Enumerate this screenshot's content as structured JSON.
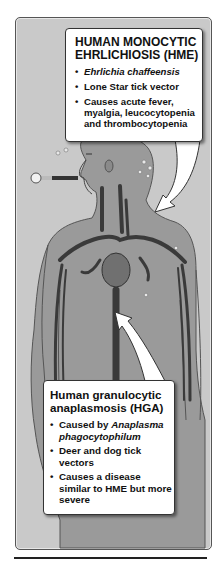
{
  "hme_callout": {
    "title_line1": "HUMAN MONOCYTIC",
    "title_line2": "EHRLICHIOSIS (HME)",
    "bullets": [
      {
        "pre": "",
        "italic": "Ehrlichia chaffeensis",
        "post": ""
      },
      {
        "pre": "Lone Star tick vector",
        "italic": "",
        "post": ""
      },
      {
        "pre": "Causes acute fever, myalgia, leucocytopenia and  thrombocytopenia",
        "italic": "",
        "post": ""
      }
    ]
  },
  "hga_callout": {
    "title_line1": "Human granulocytic",
    "title_line2": "anaplasmosis (HGA)",
    "bullets": [
      {
        "pre": "Caused by ",
        "italic": "Anaplasma phagocytophilum",
        "post": ""
      },
      {
        "pre": "Deer and dog tick vectors",
        "italic": "",
        "post": ""
      },
      {
        "pre": "Causes a disease similar to HME but more severe",
        "italic": "",
        "post": ""
      }
    ]
  },
  "bullet_glyph": "•",
  "illustration": {
    "subject": "human-body-silhouette",
    "elements": [
      "thermometer",
      "heart",
      "blood-vessels",
      "sweat-drops"
    ]
  },
  "colors": {
    "frame_bg": "#c9c9c9",
    "body_fill": "#9a9a9a",
    "vessel": "#3a3a3a",
    "callout_bg": "#ffffff"
  }
}
